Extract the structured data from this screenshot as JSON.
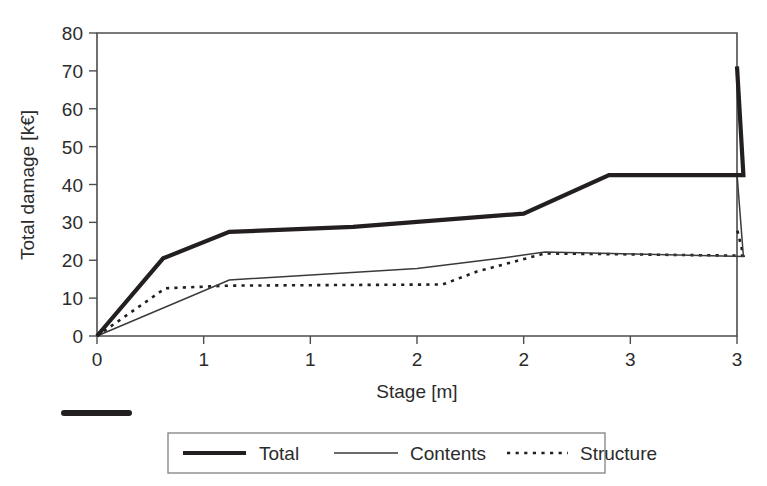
{
  "chart_data": {
    "type": "line",
    "title": "",
    "xlabel": "Stage [m]",
    "ylabel": "Total damage [k€]",
    "xlim": [
      0,
      3
    ],
    "ylim": [
      0,
      80
    ],
    "grid": false,
    "legend_position": "bottom",
    "x_tick_values": [
      0,
      0.5,
      1,
      1.5,
      2,
      2.5,
      3
    ],
    "x_tick_labels": [
      "0",
      "1",
      "1",
      "2",
      "2",
      "3",
      "3"
    ],
    "y_tick_values": [
      0,
      10,
      20,
      30,
      40,
      50,
      60,
      70,
      80
    ],
    "y_tick_labels": [
      "0",
      "10",
      "20",
      "30",
      "40",
      "50",
      "60",
      "70",
      "80"
    ],
    "series": [
      {
        "name": "Total",
        "style": "thick-solid",
        "x": [
          0,
          0.31,
          0.62,
          1.2,
          2.0,
          2.4,
          3.03,
          3.0
        ],
        "y": [
          0,
          20.5,
          27.5,
          28.8,
          32.3,
          42.5,
          42.5,
          71.2
        ],
        "points": [
          {
            "x": 0,
            "y": 0
          },
          {
            "x": 0.31,
            "y": 20.5
          },
          {
            "x": 0.62,
            "y": 27.5
          },
          {
            "x": 1.2,
            "y": 28.8
          },
          {
            "x": 2.0,
            "y": 32.3
          },
          {
            "x": 2.4,
            "y": 42.5
          },
          {
            "x": 3.03,
            "y": 42.5
          },
          {
            "x": 3.0,
            "y": 71.2
          }
        ]
      },
      {
        "name": "Contents",
        "style": "thin-solid",
        "points": [
          {
            "x": 0,
            "y": 0
          },
          {
            "x": 0.62,
            "y": 14.8
          },
          {
            "x": 1.5,
            "y": 17.8
          },
          {
            "x": 1.9,
            "y": 20.6
          },
          {
            "x": 2.1,
            "y": 22.2
          },
          {
            "x": 3.03,
            "y": 21.0
          },
          {
            "x": 3.0,
            "y": 42.8
          }
        ]
      },
      {
        "name": "Structure",
        "style": "dotted",
        "points": [
          {
            "x": 0,
            "y": 0
          },
          {
            "x": 0.32,
            "y": 12.6
          },
          {
            "x": 0.62,
            "y": 13.3
          },
          {
            "x": 1.62,
            "y": 13.6
          },
          {
            "x": 1.78,
            "y": 17.0
          },
          {
            "x": 2.1,
            "y": 21.8
          },
          {
            "x": 3.03,
            "y": 21.2
          },
          {
            "x": 3.0,
            "y": 28.3
          }
        ]
      }
    ],
    "legend": [
      {
        "label": "Total",
        "style": "thick-solid"
      },
      {
        "label": "Contents",
        "style": "thin-solid"
      },
      {
        "label": "Structure",
        "style": "dotted"
      }
    ],
    "colors": {
      "total": "#231f20",
      "contents": "#3a3a3a",
      "structure": "#231f20",
      "axis": "#4d4d4d",
      "background": "#ffffff"
    }
  }
}
